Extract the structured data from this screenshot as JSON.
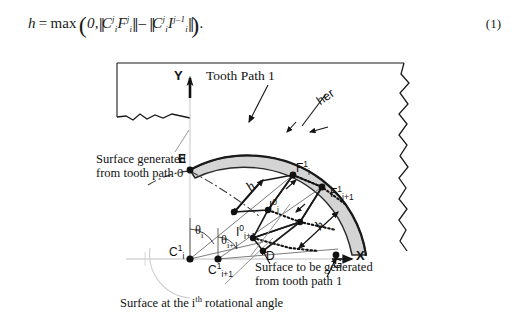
{
  "equation": {
    "lhs": "h",
    "equals": "=",
    "function": "max",
    "zero": "0,",
    "term1": {
      "base1": "C",
      "sub1": "i",
      "sup1": "j",
      "base2": "F",
      "sub2": "i",
      "sup2": "j"
    },
    "minus": "–",
    "term2": {
      "base1": "C",
      "sub1": "i",
      "sup1": "j",
      "base2": "I",
      "sub2": "i",
      "sup2": "j–1"
    },
    "period": ".",
    "number": "(1)"
  },
  "figure": {
    "axis": {
      "y_label": "Y",
      "x_label": "X"
    },
    "annotations": {
      "tooth_path_1": "Tooth Path 1",
      "cutter_rotated": "her",
      "surface_generated_0": "Surface generated\nfrom tooth path 0",
      "surface_generated_0_line1": "Surface generated",
      "surface_generated_0_line2": "from tooth path 0",
      "surface_to_be_generated_1_line1": "Surface to be generated",
      "surface_to_be_generated_1_line2": "from tooth path 1",
      "surface_ith_angle_pre": "Surface at the i",
      "surface_ith_angle_sup": "th",
      "surface_ith_angle_post": " rotational angle"
    },
    "points": {
      "E": {
        "label": "E"
      },
      "D": {
        "label": "D"
      },
      "G": {
        "label": "G"
      },
      "F_i_1": {
        "base": "F",
        "sub": "i",
        "sup": "1"
      },
      "F_ip1_1": {
        "base": "F",
        "sub": "i+1",
        "sup": "1"
      },
      "I_i_0": {
        "base": "I",
        "sub": "i",
        "sup": "0"
      },
      "I_ip1_0": {
        "base": "I",
        "sub": "i+1",
        "sup": "0"
      },
      "C_i_1": {
        "base": "C",
        "sub": "i",
        "sup": "1"
      },
      "C_ip1_1": {
        "base": "C",
        "sub": "i+1",
        "sup": "1"
      }
    },
    "angles": {
      "theta_i": {
        "base": "θ",
        "sub": "i"
      },
      "theta_ip1": {
        "base": "θ",
        "sub": "i+1"
      }
    },
    "dimensions": {
      "h_left": "h",
      "h_right": "h"
    },
    "colors": {
      "shading_light": "#d6d6d6",
      "shading_mid": "#bfbfbf",
      "outline": "#1a1a1a",
      "thin_line": "#8a8a8a"
    }
  }
}
